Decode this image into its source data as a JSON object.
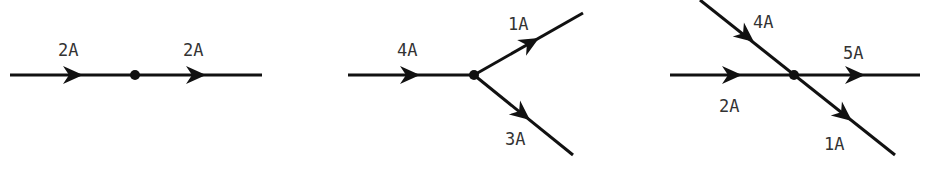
{
  "colors": {
    "line": "#111111",
    "text": "#333333",
    "background": "#ffffff"
  },
  "diagrams": [
    {
      "name": "series-junction",
      "labels": {
        "in": "2A",
        "out": "2A"
      }
    },
    {
      "name": "split-junction",
      "labels": {
        "in": "4A",
        "upper_out": "1A",
        "lower_out": "3A"
      }
    },
    {
      "name": "crossing-junction",
      "labels": {
        "diag_in": "4A",
        "horiz_in": "2A",
        "horiz_out": "5A",
        "diag_out": "1A"
      }
    }
  ]
}
